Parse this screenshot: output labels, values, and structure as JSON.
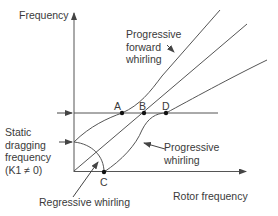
{
  "diagram": {
    "type": "campbell-diagram",
    "y_axis_label": "Frequency",
    "x_axis_label": "Rotor frequency",
    "labels": {
      "progressive_forward": [
        "Progressive",
        "forward",
        "whirling"
      ],
      "progressive": [
        "Progressive",
        "whirling"
      ],
      "regressive": "Regressive whirling",
      "static_dragging": [
        "Static",
        "dragging",
        "frequency",
        "(K1 ≠ 0)"
      ]
    },
    "points": {
      "A": "A",
      "B": "B",
      "C": "C",
      "D": "D"
    },
    "line_color": "#555555"
  }
}
